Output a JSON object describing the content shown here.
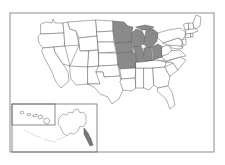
{
  "figure": {
    "kind": "choropleth-map",
    "title": "",
    "region": "United States",
    "background_color": "#ffffff",
    "frame_color": "#8d8d8d",
    "outline_color": "#5f5f5f",
    "highlight_color": "#8a8a8a",
    "plain_color": "#ffffff",
    "highlight_count": 8
  },
  "legend": {
    "highlighted_label": "Highlighted states",
    "plain_label": "Other states"
  },
  "insets": [
    {
      "name": "alaska-hawaii-inset",
      "label": ""
    },
    {
      "name": "hawaii-inset",
      "label": ""
    }
  ],
  "highlighted_states": [
    "Minnesota",
    "Wisconsin",
    "Michigan",
    "Iowa",
    "Illinois",
    "Indiana",
    "Ohio",
    "Missouri"
  ],
  "states": [
    {
      "code": "WA",
      "name": "Washington",
      "highlighted": false,
      "d": "M41,24 L46,22 L52,23 L53,19 L55,23 L63,23 L64,33 L41,34 Z"
    },
    {
      "code": "OR",
      "name": "Oregon",
      "highlighted": false,
      "d": "M41,34 L64,33 L65,46 L43,48 L39,43 L38,37 Z"
    },
    {
      "code": "CA",
      "name": "California",
      "highlighted": false,
      "d": "M43,48 L54,47 L55,52 L63,64 L68,72 L69,81 L61,88 L56,82 L51,70 L45,59 L42,52 Z"
    },
    {
      "code": "NV",
      "name": "Nevada",
      "highlighted": false,
      "d": "M54,47 L65,46 L70,66 L63,64 L55,52 Z"
    },
    {
      "code": "ID",
      "name": "Idaho",
      "highlighted": false,
      "d": "M64,33 L63,23 L68,22 L70,29 L76,31 L79,45 L65,46 Z"
    },
    {
      "code": "MT",
      "name": "Montana",
      "highlighted": false,
      "d": "M68,22 L96,20 L97,36 L79,38 L76,31 L70,29 Z"
    },
    {
      "code": "WY",
      "name": "Wyoming",
      "highlighted": false,
      "d": "M79,38 L97,36 L98,50 L80,51 Z"
    },
    {
      "code": "UT",
      "name": "Utah",
      "highlighted": false,
      "d": "M70,66 L79,45 L80,51 L89,51 L88,67 Z"
    },
    {
      "code": "CO",
      "name": "Colorado",
      "highlighted": false,
      "d": "M89,51 L98,50 L99,66 L88,67 Z"
    },
    {
      "code": "AZ",
      "name": "Arizona",
      "highlighted": false,
      "d": "M70,66 L88,67 L88,84 L76,85 L71,79 Z"
    },
    {
      "code": "NM",
      "name": "New Mexico",
      "highlighted": false,
      "d": "M88,67 L99,66 L100,84 L88,84 Z"
    },
    {
      "code": "ND",
      "name": "North Dakota",
      "highlighted": false,
      "d": "M96,20 L113,21 L113,31 L97,32 Z"
    },
    {
      "code": "SD",
      "name": "South Dakota",
      "highlighted": false,
      "d": "M97,32 L113,31 L114,42 L98,42 Z"
    },
    {
      "code": "NE",
      "name": "Nebraska",
      "highlighted": false,
      "d": "M98,42 L114,42 L116,52 L99,53 Z"
    },
    {
      "code": "KS",
      "name": "Kansas",
      "highlighted": false,
      "d": "M99,53 L117,53 L118,65 L99,66 Z"
    },
    {
      "code": "OK",
      "name": "Oklahoma",
      "highlighted": false,
      "d": "M99,66 L118,65 L120,76 L104,77 L103,72 L96,72 Z"
    },
    {
      "code": "TX",
      "name": "Texas",
      "highlighted": false,
      "d": "M88,84 L100,84 L96,72 L103,72 L104,77 L120,76 L123,90 L119,99 L112,104 L108,97 L100,94 L95,88 Z"
    },
    {
      "code": "MN",
      "name": "Minnesota",
      "highlighted": true,
      "d": "M113,21 L124,22 L128,26 L133,27 L132,33 L131,42 L115,43 L113,31 Z"
    },
    {
      "code": "IA",
      "name": "Iowa",
      "highlighted": true,
      "d": "M115,43 L131,42 L133,52 L117,53 L116,48 Z"
    },
    {
      "code": "MO",
      "name": "Missouri",
      "highlighted": true,
      "d": "M117,53 L133,52 L137,56 L136,68 L120,69 L118,65 Z"
    },
    {
      "code": "WI",
      "name": "Wisconsin",
      "highlighted": true,
      "d": "M131,42 L132,33 L136,29 L142,31 L145,37 L144,44 L137,47 L133,47 Z"
    },
    {
      "code": "MI",
      "name": "Michigan",
      "highlighted": true,
      "d": "M146,31 L153,29 L158,33 L157,41 L152,47 L147,48 L144,44 L145,37 Z"
    },
    {
      "code": "MI2",
      "name": "Michigan Upper Peninsula",
      "highlighted": true,
      "d": "M136,27 L145,25 L154,27 L150,30 L142,30 Z"
    },
    {
      "code": "IL",
      "name": "Illinois",
      "highlighted": true,
      "d": "M133,47 L141,46 L144,53 L142,62 L137,68 L136,56 Z"
    },
    {
      "code": "IN",
      "name": "Indiana",
      "highlighted": true,
      "d": "M144,48 L151,47 L152,60 L143,62 L144,53 Z"
    },
    {
      "code": "OH",
      "name": "Ohio",
      "highlighted": true,
      "d": "M152,47 L158,44 L163,47 L162,57 L153,60 Z"
    },
    {
      "code": "AR",
      "name": "Arkansas",
      "highlighted": false,
      "d": "M120,69 L136,68 L135,78 L122,79 Z"
    },
    {
      "code": "LA",
      "name": "Louisiana",
      "highlighted": false,
      "d": "M122,79 L135,78 L136,88 L131,91 L123,90 L120,82 Z"
    },
    {
      "code": "MS",
      "name": "Mississippi",
      "highlighted": false,
      "d": "M136,68 L144,68 L144,88 L136,88 Z"
    },
    {
      "code": "AL",
      "name": "Alabama",
      "highlighted": false,
      "d": "M144,68 L153,68 L154,85 L149,90 L144,88 Z"
    },
    {
      "code": "TN",
      "name": "Tennessee",
      "highlighted": false,
      "d": "M136,62 L156,60 L166,62 L165,67 L153,68 L136,68 Z"
    },
    {
      "code": "KY",
      "name": "Kentucky",
      "highlighted": false,
      "d": "M137,62 L143,62 L153,60 L162,57 L166,61 L156,60 Z"
    },
    {
      "code": "GA",
      "name": "Georgia",
      "highlighted": false,
      "d": "M153,68 L165,67 L170,76 L168,86 L158,88 L154,85 Z"
    },
    {
      "code": "FL",
      "name": "Florida",
      "highlighted": false,
      "d": "M158,88 L168,86 L172,92 L175,105 L170,109 L166,99 L158,92 Z"
    },
    {
      "code": "SC",
      "name": "South Carolina",
      "highlighted": false,
      "d": "M165,67 L173,63 L178,70 L170,76 Z"
    },
    {
      "code": "NC",
      "name": "North Carolina",
      "highlighted": false,
      "d": "M166,62 L180,57 L186,60 L178,70 L173,63 Z"
    },
    {
      "code": "VA",
      "name": "Virginia",
      "highlighted": false,
      "d": "M162,57 L170,51 L180,50 L186,56 L180,57 L166,61 Z"
    },
    {
      "code": "WV",
      "name": "West Virginia",
      "highlighted": false,
      "d": "M162,47 L168,45 L172,50 L168,54 L162,56 Z"
    },
    {
      "code": "MD",
      "name": "Maryland",
      "highlighted": false,
      "d": "M170,45 L180,44 L183,48 L178,49 L172,48 Z"
    },
    {
      "code": "DE",
      "name": "Delaware",
      "highlighted": false,
      "d": "M180,43 L183,43 L183,47 L180,46 Z"
    },
    {
      "code": "PA",
      "name": "Pennsylvania",
      "highlighted": false,
      "d": "M163,43 L178,38 L183,42 L181,46 L168,45 Z"
    },
    {
      "code": "NJ",
      "name": "New Jersey",
      "highlighted": false,
      "d": "M182,39 L186,39 L186,45 L183,45 Z"
    },
    {
      "code": "NY",
      "name": "New York",
      "highlighted": false,
      "d": "M158,33 L168,30 L180,28 L186,33 L183,40 L178,38 L163,43 L158,38 Z"
    },
    {
      "code": "CT",
      "name": "Connecticut",
      "highlighted": false,
      "d": "M186,34 L191,33 L191,37 L186,38 Z"
    },
    {
      "code": "RI",
      "name": "Rhode Island",
      "highlighted": false,
      "d": "M191,33 L193,33 L193,37 L191,37 Z"
    },
    {
      "code": "MA",
      "name": "Massachusetts",
      "highlighted": false,
      "d": "M186,30 L194,28 L198,31 L193,33 L186,34 Z"
    },
    {
      "code": "VT",
      "name": "Vermont",
      "highlighted": false,
      "d": "M184,24 L189,23 L189,29 L185,30 Z"
    },
    {
      "code": "NH",
      "name": "New Hampshire",
      "highlighted": false,
      "d": "M189,23 L193,23 L194,29 L189,29 Z"
    },
    {
      "code": "ME",
      "name": "Maine",
      "highlighted": false,
      "d": "M193,23 L196,15 L201,17 L200,26 L196,29 L194,27 Z"
    }
  ],
  "alaska": {
    "name": "Alaska",
    "d": "M59,118 L63,114 L67,115 L69,112 L73,113 L74,110 L78,109 L80,113 L83,112 L86,116 L86,123 L83,127 L80,126 L78,131 L74,134 L70,133 L67,136 L63,133 L61,128 L58,124 Z"
  },
  "alaska_islands": [
    {
      "name": "aleutian-chain-1",
      "d": "M24,130 L30,133 L36,136 L42,138"
    },
    {
      "name": "aleutian-chain-2",
      "d": "M44,139 L50,141 L56,142"
    },
    {
      "name": "aleutian-chain-3",
      "d": "M57,140 L62,138 L66,136"
    },
    {
      "name": "alaska-panhandle",
      "d": "M84,128 L88,133 L91,139 L93,145 L90,146 L87,140 L84,134 Z"
    }
  ],
  "hawaii_islands": [
    {
      "name": "kauai",
      "d": "M20,112 L23,111 L24,113 L21,114 Z"
    },
    {
      "name": "oahu",
      "d": "M27,114 L30,113 L31,115 L28,116 Z"
    },
    {
      "name": "molokai",
      "d": "M33,115 L37,114 L37,116 L33,117 Z"
    },
    {
      "name": "maui",
      "d": "M38,116 L42,115 L43,118 L39,119 Z"
    },
    {
      "name": "hawaii",
      "d": "M44,119 L48,118 L50,121 L48,124 L44,123 Z"
    }
  ],
  "inset_frames": [
    {
      "name": "alaska-hawaii-frame",
      "x": 12,
      "y": 104,
      "w": 85,
      "h": 48
    },
    {
      "name": "hawaii-frame",
      "x": 12,
      "y": 104,
      "w": 43,
      "h": 21
    }
  ],
  "outer_frame": {
    "x": 10,
    "y": 13,
    "w": 204,
    "h": 139
  }
}
